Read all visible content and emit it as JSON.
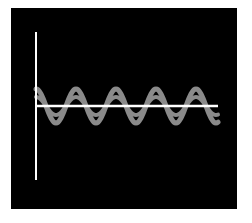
{
  "figure": {
    "background_color": "#000000",
    "page_color": "#ffffff",
    "axis_color": "#ffffff",
    "wave_color": "#8a8a8a"
  },
  "axes": {
    "vertical": {
      "x": 36,
      "y1": 32,
      "y2": 180
    },
    "horizontal": {
      "y": 106,
      "x1": 36,
      "x2": 218
    }
  },
  "waves": [
    {
      "name": "large-wave",
      "amplitude": 17,
      "period": 40,
      "phase_start_x": 36,
      "offset_y": 106,
      "x_start": 36,
      "x_end": 218,
      "stroke_width": 5
    },
    {
      "name": "small-wave",
      "amplitude": 9,
      "period": 40,
      "phase_start_x": 36,
      "offset_y": 106,
      "x_start": 36,
      "x_end": 218,
      "stroke_width": 4
    }
  ]
}
